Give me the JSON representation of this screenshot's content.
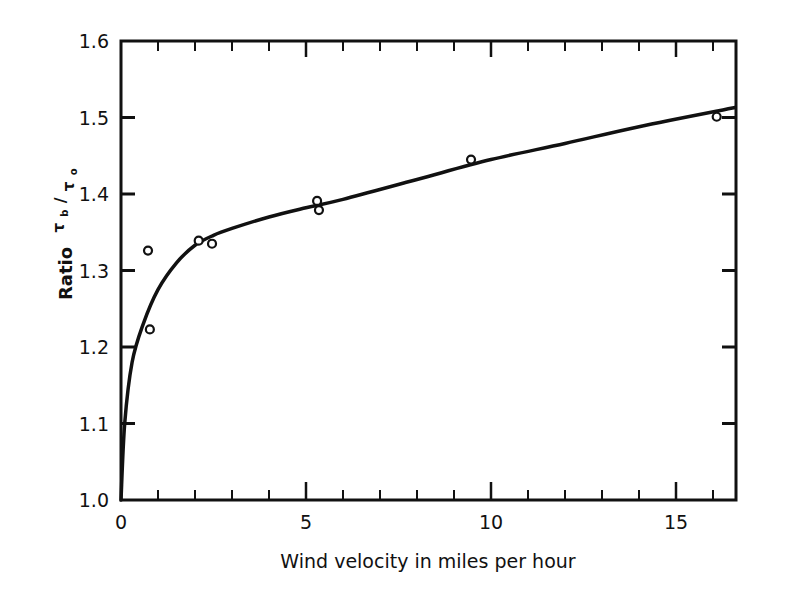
{
  "chart_data": {
    "type": "scatter",
    "title": "",
    "xlabel": "Wind velocity in miles per hour",
    "ylabel": "Ratio τb/τo",
    "ylabel_parts": {
      "word": "Ratio",
      "num": "τ",
      "num_sub": "b",
      "den": "τ",
      "den_sub": "o"
    },
    "xlim": [
      0,
      16.6
    ],
    "ylim": [
      1.0,
      1.6
    ],
    "x_ticks_major": [
      0,
      5,
      10,
      15
    ],
    "x_tick_labels": [
      "0",
      "5",
      "10",
      "15"
    ],
    "x_ticks_minor": [
      1,
      2,
      3,
      4,
      6,
      7,
      8,
      9,
      11,
      12,
      13,
      14,
      16
    ],
    "y_ticks": [
      1.0,
      1.1,
      1.2,
      1.3,
      1.4,
      1.5,
      1.6
    ],
    "y_tick_labels": [
      "1.0",
      "1.1",
      "1.2",
      "1.3",
      "1.4",
      "1.5",
      "1.6"
    ],
    "grid": false,
    "legend": null,
    "series": [
      {
        "name": "Observations",
        "kind": "scatter",
        "marker": "open-circle",
        "points": [
          {
            "x": 0.73,
            "y": 1.326
          },
          {
            "x": 0.78,
            "y": 1.223
          },
          {
            "x": 2.1,
            "y": 1.339
          },
          {
            "x": 2.46,
            "y": 1.335
          },
          {
            "x": 5.3,
            "y": 1.391
          },
          {
            "x": 5.35,
            "y": 1.379
          },
          {
            "x": 9.46,
            "y": 1.445
          },
          {
            "x": 16.1,
            "y": 1.501
          }
        ]
      },
      {
        "name": "Fitted curve",
        "kind": "line",
        "points": [
          {
            "x": 0.0,
            "y": 1.0
          },
          {
            "x": 0.1,
            "y": 1.1
          },
          {
            "x": 0.3,
            "y": 1.18
          },
          {
            "x": 0.6,
            "y": 1.23
          },
          {
            "x": 1.0,
            "y": 1.275
          },
          {
            "x": 1.5,
            "y": 1.31
          },
          {
            "x": 2.0,
            "y": 1.333
          },
          {
            "x": 2.5,
            "y": 1.346
          },
          {
            "x": 3.0,
            "y": 1.355
          },
          {
            "x": 4.0,
            "y": 1.37
          },
          {
            "x": 5.0,
            "y": 1.382
          },
          {
            "x": 6.0,
            "y": 1.393
          },
          {
            "x": 8.0,
            "y": 1.419
          },
          {
            "x": 10.0,
            "y": 1.445
          },
          {
            "x": 12.0,
            "y": 1.466
          },
          {
            "x": 14.0,
            "y": 1.488
          },
          {
            "x": 16.6,
            "y": 1.513
          }
        ]
      }
    ]
  },
  "plot_frame": {
    "left": 121,
    "right": 736,
    "top": 41,
    "bottom": 500
  },
  "colors": {
    "ink": "#111111",
    "background": "#ffffff"
  }
}
